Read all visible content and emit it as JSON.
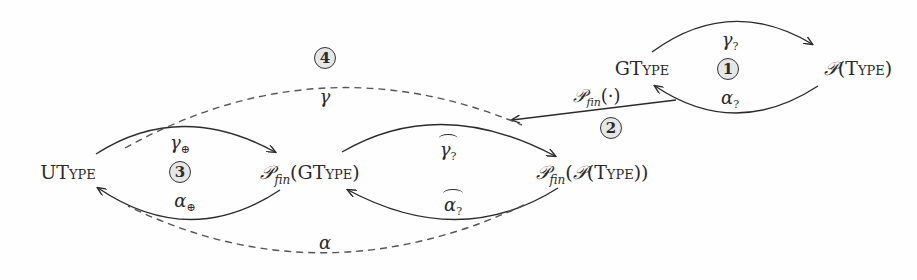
{
  "diagram": {
    "nodes": {
      "gtype": "GType",
      "ptype_prefix": "𝒫",
      "ptype_arg": "Type",
      "utype": "UType",
      "pfin_gtype_arg": "GType",
      "pfin_ptype_arg": "Type",
      "pfin_symbol": "𝒫",
      "fin_sub": "fin"
    },
    "edges": {
      "gamma_q": {
        "sym": "γ",
        "sub": "?"
      },
      "alpha_q": {
        "sym": "α",
        "sub": "?"
      },
      "pfin_map": {
        "sym": "𝒫",
        "sub": "fin",
        "arg": "(·)"
      },
      "gamma_hat_q": {
        "sym": "γ",
        "sub": "?"
      },
      "alpha_hat_q": {
        "sym": "α",
        "sub": "?"
      },
      "gamma_oplus": {
        "sym": "γ",
        "sub": "⊕"
      },
      "alpha_oplus": {
        "sym": "α",
        "sub": "⊕"
      },
      "gamma": {
        "sym": "γ"
      },
      "alpha": {
        "sym": "α"
      }
    },
    "markers": [
      "1",
      "2",
      "3",
      "4"
    ],
    "colors": {
      "ink": "#2b2b2b",
      "dashed": "#555555",
      "marker_fill": "#e6e6e6"
    }
  }
}
